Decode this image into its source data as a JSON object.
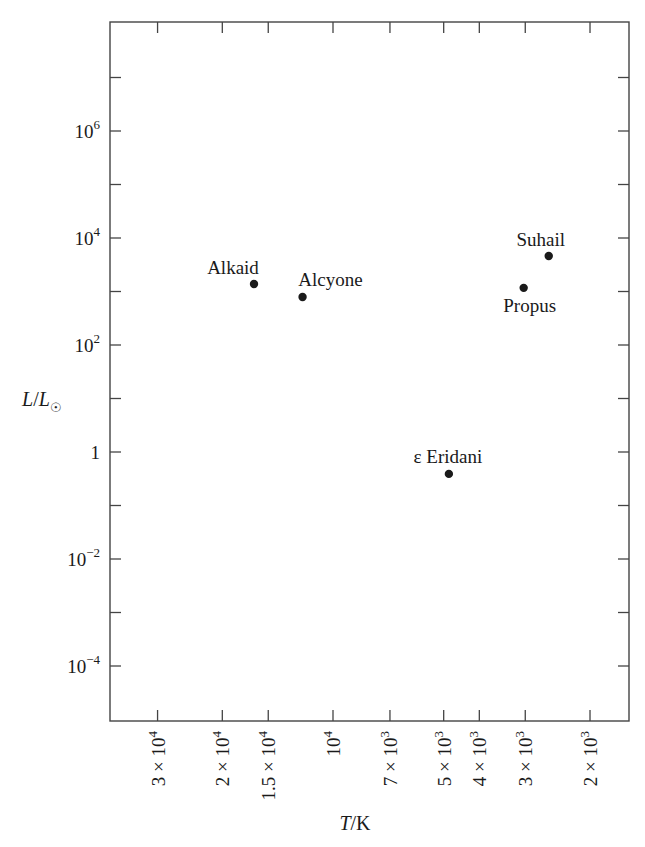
{
  "chart_data": {
    "type": "scatter",
    "title": "",
    "xlabel": "T/K",
    "ylabel": "L/L☉",
    "x_scale": "log",
    "x_reversed": true,
    "y_scale": "log",
    "xlim": [
      37000,
      1600
    ],
    "ylim": [
      1e-05,
      100000000.0
    ],
    "grid": false,
    "legend": null,
    "x_ticks": [
      {
        "value": 30000,
        "label": "3 × 10",
        "exp": "4"
      },
      {
        "value": 20000,
        "label": "2 × 10",
        "exp": "4"
      },
      {
        "value": 15000,
        "label": "1.5 × 10",
        "exp": "4"
      },
      {
        "value": 10000,
        "label": "10",
        "exp": "4"
      },
      {
        "value": 7000,
        "label": "7 × 10",
        "exp": "3"
      },
      {
        "value": 5000,
        "label": "5 × 10",
        "exp": "3"
      },
      {
        "value": 4000,
        "label": "4 × 10",
        "exp": "3"
      },
      {
        "value": 3000,
        "label": "3 × 10",
        "exp": "3"
      },
      {
        "value": 2000,
        "label": "2 × 10",
        "exp": "3"
      }
    ],
    "y_ticks": [
      {
        "value": 10000000.0,
        "label": "",
        "exp": ""
      },
      {
        "value": 1000000.0,
        "label": "10",
        "exp": "6"
      },
      {
        "value": 100000.0,
        "label": "",
        "exp": ""
      },
      {
        "value": 10000.0,
        "label": "10",
        "exp": "4"
      },
      {
        "value": 1000.0,
        "label": "",
        "exp": ""
      },
      {
        "value": 100.0,
        "label": "10",
        "exp": "2"
      },
      {
        "value": 10,
        "label": "",
        "exp": ""
      },
      {
        "value": 1,
        "label": "1",
        "exp": ""
      },
      {
        "value": 0.1,
        "label": "",
        "exp": ""
      },
      {
        "value": 0.01,
        "label": "10",
        "exp": "−2"
      },
      {
        "value": 0.001,
        "label": "",
        "exp": ""
      },
      {
        "value": 0.0001,
        "label": "10",
        "exp": "−4"
      }
    ],
    "points": [
      {
        "name": "Alkaid",
        "T": 16400,
        "L": 1380,
        "label_pos": "above-left"
      },
      {
        "name": "Alcyone",
        "T": 12100,
        "L": 790,
        "label_pos": "above"
      },
      {
        "name": "Suhail",
        "T": 2590,
        "L": 4600,
        "label_pos": "above-left"
      },
      {
        "name": "Propus",
        "T": 3030,
        "L": 1170,
        "label_pos": "below"
      },
      {
        "name": "ε Eridani",
        "T": 4840,
        "L": 0.39,
        "label_pos": "above"
      }
    ],
    "marker_color": "#1a1a1a"
  }
}
